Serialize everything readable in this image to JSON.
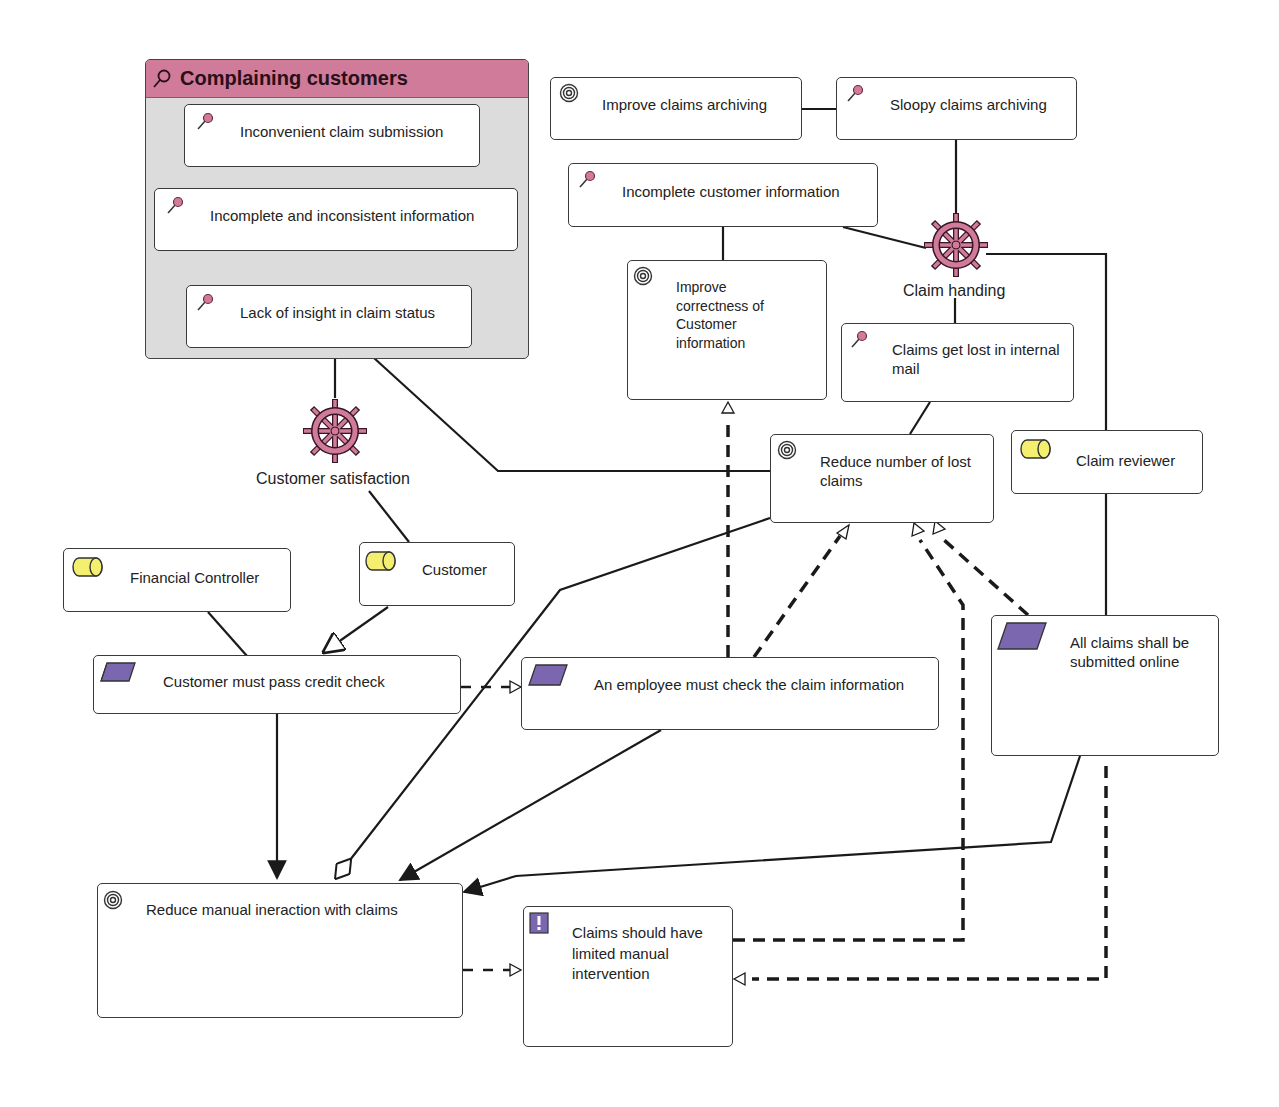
{
  "colors": {
    "problem_pink": "#cf7b99",
    "driver_pink": "#b04b78",
    "actor_yellow": "#f4ef6e",
    "principle_purple": "#7a67b0",
    "group_bg": "#dcdcdc",
    "line": "#1a1a1a"
  },
  "group": {
    "title": "Complaining customers",
    "icon": "assessment-icon",
    "items": [
      {
        "label": "Inconvenient claim submission",
        "icon": "assessment-icon"
      },
      {
        "label": "Incomplete and inconsistent information",
        "icon": "assessment-icon"
      },
      {
        "label": "Lack of insight in claim status",
        "icon": "assessment-icon"
      }
    ]
  },
  "nodes": {
    "improve_archiving": {
      "label": "Improve claims archiving",
      "icon": "goal-icon"
    },
    "sloopy_archiving": {
      "label": "Sloopy claims archiving",
      "icon": "assessment-icon"
    },
    "incomplete_customer_info": {
      "label": "Incomplete customer information",
      "icon": "assessment-icon"
    },
    "improve_correctness": {
      "label": "Improve correctness of Customer information",
      "icon": "goal-icon"
    },
    "claims_lost_mail": {
      "label": "Claims get lost in internal mail",
      "icon": "assessment-icon"
    },
    "reduce_lost_claims": {
      "label": "Reduce number of lost claims",
      "icon": "goal-icon"
    },
    "claim_reviewer": {
      "label": "Claim reviewer",
      "icon": "stakeholder-icon"
    },
    "financial_controller": {
      "label": "Financial Controller",
      "icon": "stakeholder-icon"
    },
    "customer": {
      "label": "Customer",
      "icon": "stakeholder-icon"
    },
    "credit_check": {
      "label": "Customer must pass credit check",
      "icon": "requirement-icon"
    },
    "employee_check": {
      "label": "An employee must check the claim information",
      "icon": "requirement-icon"
    },
    "submit_online": {
      "label": "All claims shall be submitted online",
      "icon": "requirement-icon"
    },
    "reduce_manual": {
      "label": "Reduce manual ineraction with claims",
      "icon": "goal-icon"
    },
    "limited_manual": {
      "label": "Claims should have limited manual intervention",
      "icon": "principle-icon"
    }
  },
  "drivers": {
    "claim_handling": {
      "label": "Claim handing",
      "icon": "driver-icon"
    },
    "customer_satisfaction": {
      "label": "Customer satisfaction",
      "icon": "driver-icon"
    }
  }
}
